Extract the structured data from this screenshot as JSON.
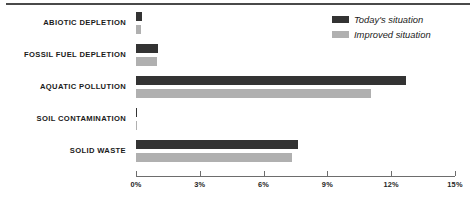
{
  "chart_data": {
    "type": "bar",
    "orientation": "horizontal",
    "title": "",
    "xlabel": "",
    "ylabel": "",
    "xlim": [
      0,
      15
    ],
    "xticks": [
      0,
      3,
      6,
      9,
      12,
      15
    ],
    "xtick_labels": [
      "0%",
      "3%",
      "6%",
      "9%",
      "12%",
      "15%"
    ],
    "grid": false,
    "legend_position": "top-right",
    "categories": [
      "ABIOTIC DEPLETION",
      "FOSSIL FUEL DEPLETION",
      "AQUATIC POLLUTION",
      "SOIL CONTAMINATION",
      "SOLID WASTE"
    ],
    "series": [
      {
        "name": "Today's situation",
        "color": "#333333",
        "values": [
          0.3,
          1.05,
          12.7,
          0.03,
          7.6
        ]
      },
      {
        "name": "Improved situation",
        "color": "#b0b0b0",
        "values": [
          0.22,
          1.0,
          11.05,
          0.03,
          7.35
        ]
      }
    ]
  },
  "legend": {
    "items": [
      {
        "label": "Today's situation",
        "swatch": "dark"
      },
      {
        "label": "Improved situation",
        "swatch": "light"
      }
    ]
  },
  "colors": {
    "series_dark": "#333333",
    "series_light": "#b0b0b0",
    "axis": "#6d6d6d",
    "text": "#1a1a1a",
    "top_rule": "#4a4a4a",
    "background": "#ffffff"
  }
}
